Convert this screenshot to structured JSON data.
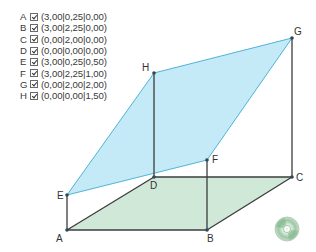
{
  "legend": {
    "items": [
      {
        "name": "A",
        "checked": true,
        "coords": "(3,00|0,25|0,00)"
      },
      {
        "name": "B",
        "checked": true,
        "coords": "(3,00|2,25|0,00)"
      },
      {
        "name": "C",
        "checked": true,
        "coords": "(0,00|2,00|0,00)"
      },
      {
        "name": "D",
        "checked": true,
        "coords": "(0,00|0,00|0,00)"
      },
      {
        "name": "E",
        "checked": true,
        "coords": "(3,00|0,25|0,50)"
      },
      {
        "name": "F",
        "checked": true,
        "coords": "(3,00|2,25|1,00)"
      },
      {
        "name": "G",
        "checked": true,
        "coords": "(0,00|2,00|2,00)"
      },
      {
        "name": "H",
        "checked": true,
        "coords": "(0,00|0,00|1,50)"
      }
    ]
  },
  "figure": {
    "points": {
      "A": {
        "label": "A",
        "x": 67,
        "y": 230
      },
      "B": {
        "label": "B",
        "x": 207,
        "y": 230
      },
      "C": {
        "label": "C",
        "x": 292,
        "y": 177
      },
      "D": {
        "label": "D",
        "x": 154,
        "y": 177
      },
      "E": {
        "label": "E",
        "x": 67,
        "y": 195
      },
      "F": {
        "label": "F",
        "x": 207,
        "y": 160
      },
      "G": {
        "label": "G",
        "x": 292,
        "y": 38
      },
      "H": {
        "label": "H",
        "x": 154,
        "y": 73
      }
    },
    "colors": {
      "base_fill": "#cfe8d8",
      "plane_fill": "#b8e6f5",
      "plane_edge": "#4fb3d9",
      "edge": "#3c3c3c"
    }
  },
  "icons": {
    "cd": "cd-disc-icon"
  }
}
